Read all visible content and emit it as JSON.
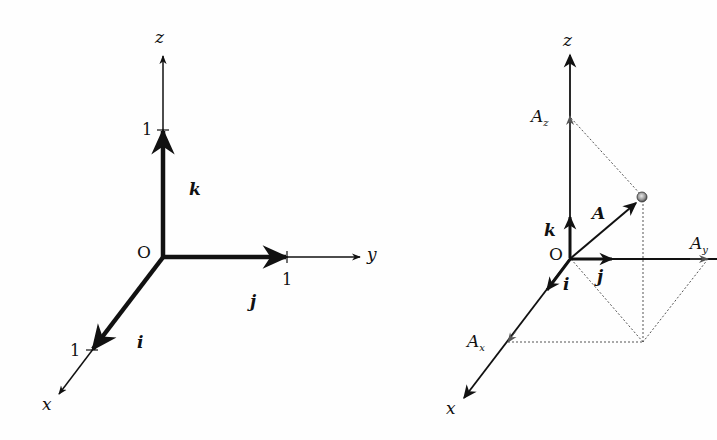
{
  "left_figure": {
    "title": "Unit vectors i, j, k",
    "origin_label": "O",
    "axes": {
      "x": {
        "label": "x",
        "tick_label": "1"
      },
      "y": {
        "label": "y",
        "tick_label": "1"
      },
      "z": {
        "label": "z",
        "tick_label": "1"
      }
    },
    "unit_vectors": {
      "i": "i",
      "j": "j",
      "k": "k"
    }
  },
  "right_figure": {
    "title": "Vector A and its components",
    "origin_label": "O",
    "axes": {
      "x": {
        "label": "x"
      },
      "y": {
        "label": "y"
      },
      "z": {
        "label": "z"
      }
    },
    "unit_vectors": {
      "i": "i",
      "j": "j",
      "k": "k"
    },
    "vector_label": "A",
    "components": {
      "Ax": {
        "base": "A",
        "sub": "x"
      },
      "Ay": {
        "base": "A",
        "sub": "y"
      },
      "Az": {
        "base": "A",
        "sub": "z"
      }
    }
  },
  "colors": {
    "ink": "#111111",
    "dotted": "#555555",
    "point": "#888888",
    "background": "#fefefe"
  }
}
